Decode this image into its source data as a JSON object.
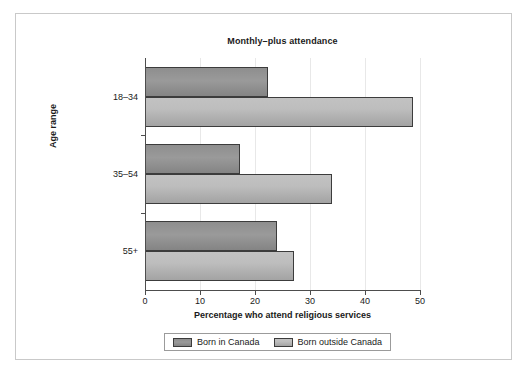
{
  "chart_data": {
    "type": "bar",
    "orientation": "horizontal",
    "title": "Monthly–plus attendance",
    "xlabel": "Percentage who attend religious services",
    "ylabel": "Age range",
    "categories": [
      "18–34",
      "35–54",
      "55+"
    ],
    "series": [
      {
        "name": "Born in Canada",
        "values": [
          22.4,
          17.3,
          24.0
        ],
        "color": "#8e8e8e"
      },
      {
        "name": "Born outside Canada",
        "values": [
          48.8,
          34.0,
          27.0
        ],
        "color": "#c2c2c2"
      }
    ],
    "xlim": [
      0,
      50
    ],
    "xticks": [
      0,
      10,
      20,
      30,
      40,
      50
    ],
    "xtick_labels": [
      "0",
      "10",
      "20",
      "30",
      "40",
      "50"
    ],
    "grid": true,
    "legend_position": "bottom"
  },
  "legend": {
    "entries": [
      {
        "label": "Born in Canada"
      },
      {
        "label": "Born outside Canada"
      }
    ]
  },
  "colors": {
    "series_in_canada": "#8e8e8e",
    "series_outside_canada": "#c2c2c2",
    "axis": "#4d4d4d",
    "gridline": "#e8e8e8",
    "frame": "#c9c9c9",
    "text": "#1a1a1a"
  }
}
